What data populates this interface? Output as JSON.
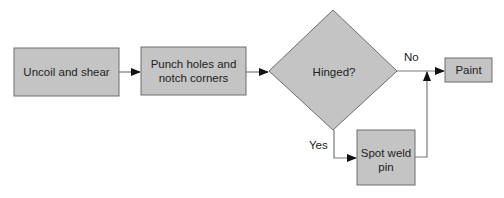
{
  "diagram": {
    "type": "flowchart",
    "colors": {
      "fill": "#c4c4c4",
      "border": "#6e6e6e",
      "line": "#7a7a7a",
      "arrow": "#111111",
      "text": "#222222"
    },
    "nodes": [
      {
        "id": "uncoil",
        "shape": "rect",
        "lines": [
          "Uncoil and shear"
        ]
      },
      {
        "id": "punch",
        "shape": "rect",
        "lines": [
          "Punch holes and",
          "notch corners"
        ]
      },
      {
        "id": "hinged",
        "shape": "diamond",
        "lines": [
          "Hinged?"
        ]
      },
      {
        "id": "paint",
        "shape": "rect",
        "lines": [
          "Paint"
        ]
      },
      {
        "id": "spotweld",
        "shape": "rect",
        "lines": [
          "Spot weld",
          "pin"
        ]
      }
    ],
    "edges": [
      {
        "from": "uncoil",
        "to": "punch",
        "label": ""
      },
      {
        "from": "punch",
        "to": "hinged",
        "label": ""
      },
      {
        "from": "hinged",
        "to": "paint",
        "label": "No"
      },
      {
        "from": "hinged",
        "to": "spotweld",
        "label": "Yes"
      },
      {
        "from": "spotweld",
        "to": "paint",
        "label": ""
      }
    ]
  }
}
